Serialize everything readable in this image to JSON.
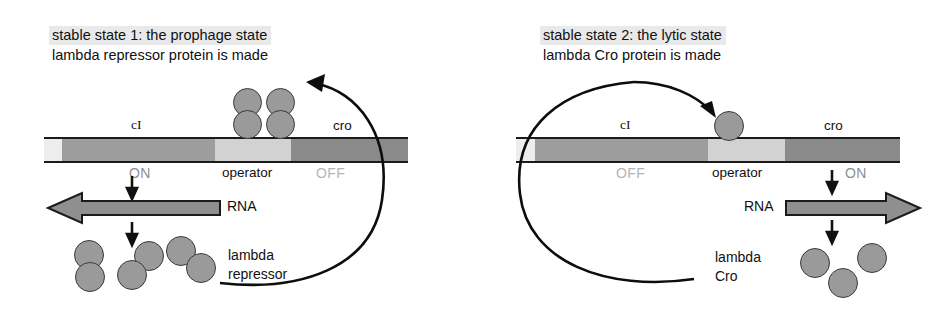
{
  "figure": {
    "kind": "lambda-phage-genetic-switch-diagram",
    "panels": [
      {
        "id": "prophage",
        "title_line1": "stable state 1: the prophage state",
        "title_line2": "lambda repressor protein is made",
        "gene_left_label": "cI",
        "gene_right_label": "cro",
        "operator_label": "operator",
        "left_gene_state": "ON",
        "right_gene_state": "OFF",
        "rna_label": "RNA",
        "rna_direction": "left",
        "protein_label": "lambda\nrepressor",
        "bound_protein": "repressor dimers bound to operator",
        "bound_units": 2,
        "free_protein_units": 3,
        "protein_form": "dimer"
      },
      {
        "id": "lytic",
        "title_line1": "stable state 2: the lytic state",
        "title_line2": "lambda Cro protein is made",
        "gene_left_label": "cI",
        "gene_right_label": "cro",
        "operator_label": "operator",
        "left_gene_state": "OFF",
        "right_gene_state": "ON",
        "rna_label": "RNA",
        "rna_direction": "right",
        "protein_label": "lambda\nCro",
        "bound_protein": "Cro monomer bound to operator",
        "bound_units": 1,
        "free_protein_units": 3,
        "protein_form": "monomer"
      }
    ],
    "colors": {
      "background": "#ffffff",
      "title_highlight": "#e9e9e9",
      "dna_outline": "#1b1b1b",
      "dna_promoter": "#ededed",
      "dna_cI": "#9d9d9d",
      "dna_operator": "#d2d2d2",
      "dna_cro": "#8a8a8a",
      "protein_fill": "#9a9a9a",
      "protein_stroke": "#3a3a3a",
      "rna_arrow_fill": "#8f8f8f",
      "state_on_text": "#8e8e8e",
      "state_off_text": "#b4b4b4",
      "text": "#101010"
    }
  }
}
